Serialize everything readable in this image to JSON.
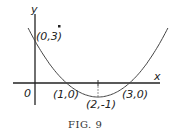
{
  "figure": {
    "caption": "Fig. 9",
    "caption_display": "FIG. 9",
    "axis_labels": {
      "x": "x",
      "y": "y",
      "origin": "0"
    },
    "curve_equation": "y = (x-1)(x-3)",
    "points": [
      {
        "label": "(0,3)",
        "x": 0,
        "y": 3
      },
      {
        "label": "(1,0)",
        "x": 1,
        "y": 0
      },
      {
        "label": "(2,-1)",
        "x": 2,
        "y": -1
      },
      {
        "label": "(3,0)",
        "x": 3,
        "y": 0
      }
    ],
    "stroke_color": "#333333"
  },
  "chart_data": {
    "type": "line",
    "title": "Fig. 9",
    "xlabel": "x",
    "ylabel": "y",
    "series": [
      {
        "name": "parabola y = x^2 - 4x + 3",
        "x": [
          -0.2,
          0,
          0.5,
          1,
          1.5,
          2,
          2.5,
          3,
          3.5,
          4,
          4.2
        ],
        "values": [
          3.84,
          3,
          1.25,
          0,
          -0.75,
          -1,
          -0.75,
          0,
          1.25,
          3,
          3.84
        ]
      }
    ],
    "annotations": [
      "(0,3)",
      "(1,0)",
      "(2,-1)",
      "(3,0)"
    ],
    "grid": false
  }
}
